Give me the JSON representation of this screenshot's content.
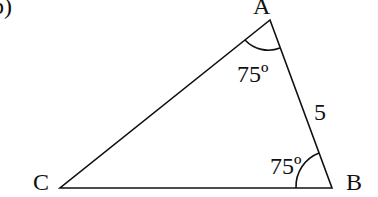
{
  "part_label": "b)",
  "triangle": {
    "vertices": {
      "A": {
        "label": "A"
      },
      "B": {
        "label": "B"
      },
      "C": {
        "label": "C"
      }
    },
    "angles": {
      "A": "75º",
      "B": "75º"
    },
    "sides": {
      "AB": "5"
    }
  },
  "colors": {
    "stroke": "#111111",
    "background": "#ffffff"
  }
}
